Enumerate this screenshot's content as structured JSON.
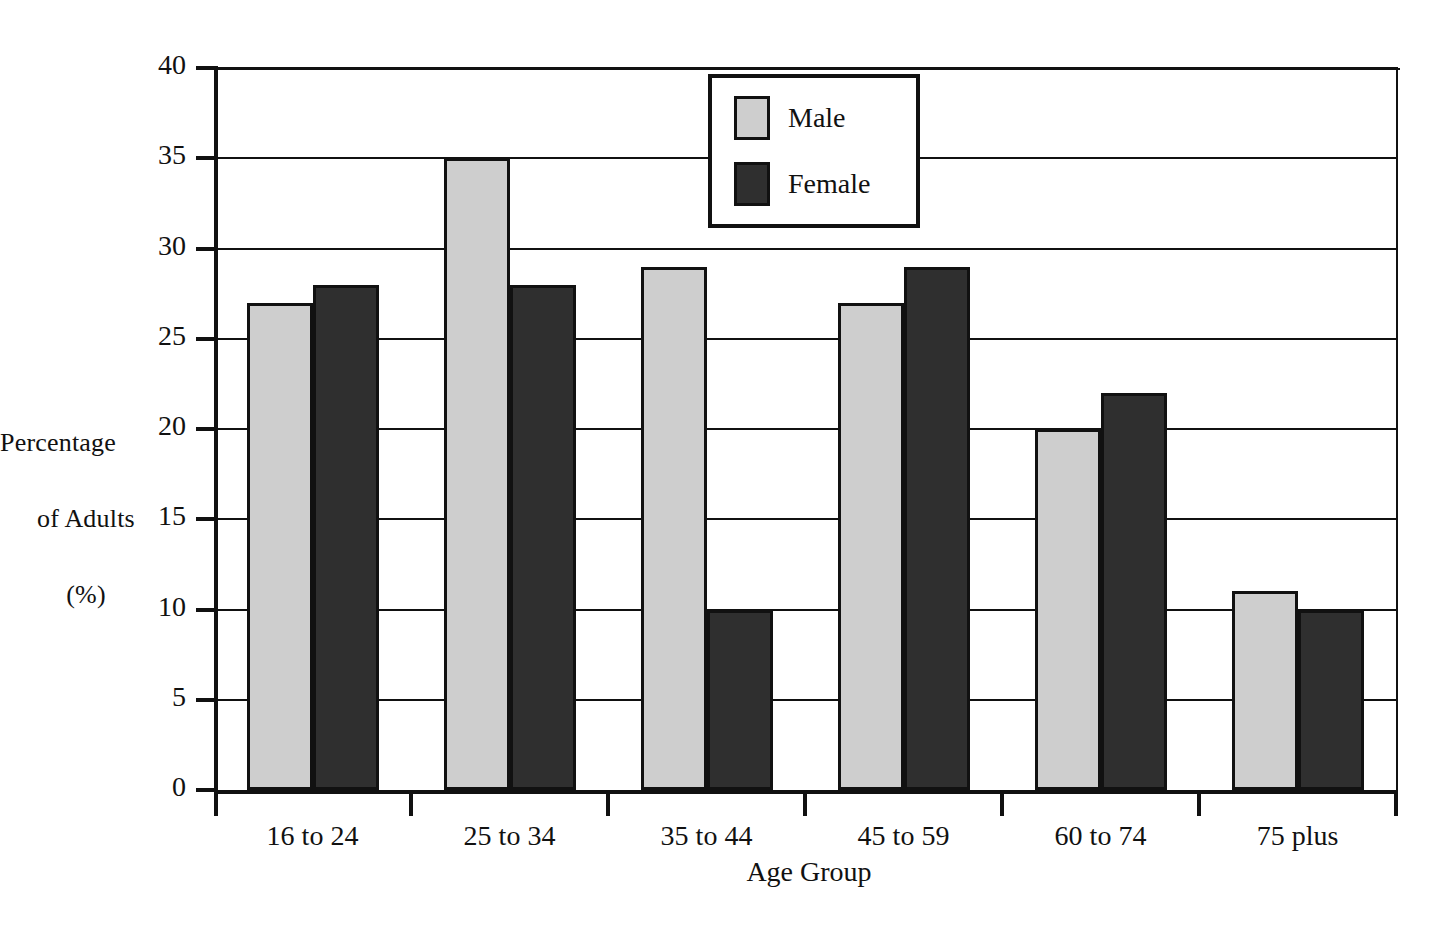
{
  "chart_data": {
    "type": "bar",
    "title": "",
    "xlabel": "Age Group",
    "ylabel": "Percentage of Adults (%)",
    "ylabel_lines": [
      "Percentage",
      "of Adults",
      "(%)"
    ],
    "categories": [
      "16 to 24",
      "25 to 34",
      "35 to 44",
      "45 to 59",
      "60 to 74",
      "75 plus"
    ],
    "series": [
      {
        "name": "Male",
        "color": "#cecece",
        "values": [
          27,
          35,
          29,
          27,
          20,
          11
        ]
      },
      {
        "name": "Female",
        "color": "#2f2f2f",
        "values": [
          28,
          28,
          10,
          29,
          22,
          10
        ]
      }
    ],
    "ylim": [
      0,
      40
    ],
    "y_ticks": [
      0,
      5,
      10,
      15,
      20,
      25,
      30,
      35,
      40
    ],
    "y_tick_labels": [
      "0",
      "5",
      "10",
      "15",
      "20",
      "25",
      "30",
      "35",
      "40"
    ],
    "grid": true,
    "grid_axis": "y",
    "legend_position": "top-center",
    "legend_entries": [
      "Male",
      "Female"
    ]
  },
  "axes": {
    "y_title_line_1": "Percentage",
    "y_title_line_2": "of Adults",
    "y_title_line_3": "(%)",
    "x_title": "Age Group"
  },
  "legend": {
    "male_label": "Male",
    "female_label": "Female"
  },
  "colors": {
    "male": "#cecece",
    "female": "#2f2f2f",
    "axis": "#111111",
    "background": "#ffffff"
  }
}
